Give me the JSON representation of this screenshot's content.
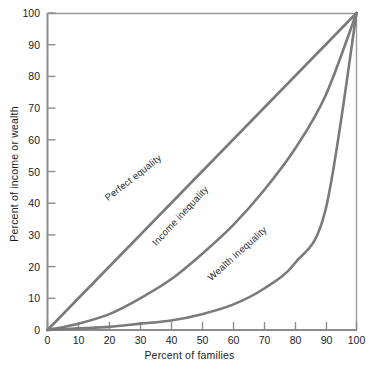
{
  "chart_data": {
    "type": "line",
    "title": "",
    "subtitle": "",
    "xlabel": "Percent of families",
    "ylabel": "Percent of income or wealth",
    "xlim": [
      0,
      100
    ],
    "ylim": [
      0,
      100
    ],
    "grid": false,
    "legend_position": "inline-annotations",
    "xticks": [
      "0",
      "10",
      "20",
      "30",
      "40",
      "50",
      "60",
      "70",
      "80",
      "90",
      "100"
    ],
    "yticks": [
      "0",
      "10",
      "20",
      "30",
      "40",
      "50",
      "60",
      "70",
      "80",
      "90",
      "100"
    ],
    "x": [
      0,
      10,
      20,
      30,
      40,
      50,
      60,
      70,
      80,
      90,
      100
    ],
    "series": [
      {
        "name": "Perfect equality",
        "color": "#7a7a7a",
        "values": [
          0,
          10,
          20,
          30,
          40,
          50,
          60,
          70,
          80,
          90,
          100
        ],
        "label_x": 40,
        "label_y": 44
      },
      {
        "name": "Income inequality",
        "color": "#7a7a7a",
        "values": [
          0,
          2,
          5,
          10,
          16,
          24,
          33,
          44,
          57,
          74,
          100
        ],
        "label_x": 57,
        "label_y": 32
      },
      {
        "name": "Wealth inequality",
        "color": "#7a7a7a",
        "values": [
          0,
          0.5,
          1,
          2,
          3,
          5,
          8,
          13,
          21,
          38,
          100
        ],
        "label_x": 75,
        "label_y": 20
      }
    ],
    "annotations": [
      {
        "text": "Perfect equality",
        "rotation": -38
      },
      {
        "text": "Income inequality",
        "rotation": -47
      },
      {
        "text": "Wealth inequality",
        "rotation": -42
      }
    ],
    "colors": {
      "axis": "#8c8c8c",
      "curve": "#7a7a7a",
      "text": "#1c1c1c",
      "background": "#ffffff"
    }
  }
}
